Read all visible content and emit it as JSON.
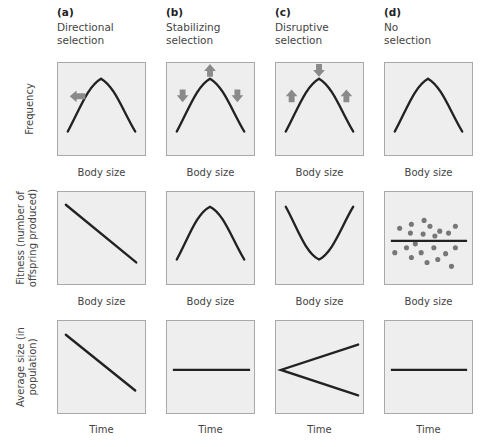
{
  "columns": [
    {
      "letter": "(a)",
      "line1": "Directional",
      "line2": "selection"
    },
    {
      "letter": "(b)",
      "line1": "Stabilizing",
      "line2": "selection"
    },
    {
      "letter": "(c)",
      "line1": "Disruptive",
      "line2": "selection"
    },
    {
      "letter": "(d)",
      "line1": "No",
      "line2": "selection"
    }
  ],
  "rows": [
    {
      "ylabel_line1": "Frequency",
      "ylabel_line2": "",
      "xlabel": "Body size"
    },
    {
      "ylabel_line1": "Fitness (number of",
      "ylabel_line2": "offspring produced)",
      "xlabel": "Body size"
    },
    {
      "ylabel_line1": "Average size (in",
      "ylabel_line2": "population)",
      "xlabel": "Time"
    }
  ],
  "colors": {
    "panel_fill": "#eeeeee",
    "panel_border": "#a9a9a9",
    "curve": "#222222",
    "arrow": "#8a8a8a",
    "dots": "#777777"
  },
  "panels": {
    "frequency": {
      "a": {
        "curve": "bell",
        "arrows": [
          "left"
        ]
      },
      "b": {
        "curve": "bell",
        "arrows": [
          "up-center",
          "down-left",
          "down-right"
        ]
      },
      "c": {
        "curve": "bell",
        "arrows": [
          "down-center",
          "up-left",
          "up-right"
        ]
      },
      "d": {
        "curve": "bell",
        "arrows": []
      }
    },
    "fitness": {
      "a": {
        "curve": "line-decreasing"
      },
      "b": {
        "curve": "bell"
      },
      "c": {
        "curve": "u-shape"
      },
      "d": {
        "curve": "flat-line",
        "scatter": "random-points"
      }
    },
    "average_size": {
      "a": {
        "curve": "line-decreasing"
      },
      "b": {
        "curve": "flat-line"
      },
      "c": {
        "curve": "diverging-split"
      },
      "d": {
        "curve": "flat-line"
      }
    }
  }
}
